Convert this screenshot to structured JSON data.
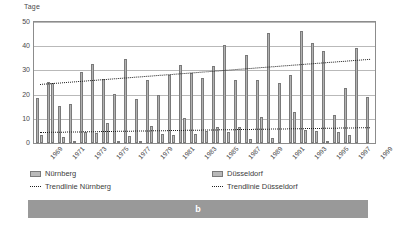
{
  "figure": {
    "caption_label": "b",
    "y_axis_title": "Tage"
  },
  "legend": {
    "items": [
      {
        "label": "Nürnberg",
        "marker": "swatch"
      },
      {
        "label": "Düsseldorf",
        "marker": "swatch"
      },
      {
        "label": "Trendlinie Nürnberg",
        "marker": "dotted-line"
      },
      {
        "label": "Trendlinie Düsseldorf",
        "marker": "dotted-line"
      }
    ]
  },
  "chart_data": {
    "type": "bar",
    "title": "",
    "subtitle": "",
    "xlabel": "",
    "ylabel": "Tage",
    "ylim": [
      0,
      50
    ],
    "yticks": [
      0,
      10,
      20,
      30,
      40,
      50
    ],
    "grid": true,
    "legend_position": "bottom",
    "categories": [
      "1969",
      "1970",
      "1971",
      "1972",
      "1973",
      "1974",
      "1975",
      "1976",
      "1977",
      "1978",
      "1979",
      "1980",
      "1981",
      "1982",
      "1983",
      "1984",
      "1985",
      "1986",
      "1987",
      "1988",
      "1989",
      "1990",
      "1991",
      "1992",
      "1993",
      "1994",
      "1995",
      "1996",
      "1997",
      "1998",
      "1999"
    ],
    "tick_labels": [
      "1969",
      "",
      "1971",
      "",
      "1973",
      "",
      "1975",
      "",
      "1977",
      "",
      "1979",
      "",
      "1981",
      "",
      "1983",
      "",
      "1985",
      "",
      "1987",
      "",
      "1989",
      "",
      "1991",
      "",
      "1993",
      "",
      "1995",
      "",
      "1997",
      "",
      "1999"
    ],
    "series": [
      {
        "name": "Nürnberg",
        "values": [
          18.5,
          25.3,
          15.2,
          16.3,
          29.5,
          32.7,
          26.3,
          20.3,
          34.8,
          18.2,
          26.2,
          20.0,
          28.3,
          32.3,
          29.0,
          27.0,
          32.0,
          40.4,
          26.0,
          36.2,
          26.2,
          45.5,
          25.0,
          28.3,
          46.3,
          41.3,
          38.2,
          11.6,
          22.8,
          39.3,
          19.1
        ]
      },
      {
        "name": "Düsseldorf",
        "values": [
          3.5,
          25.0,
          2.4,
          0.2,
          4.4,
          4.3,
          8.1,
          0.4,
          2.8,
          1.0,
          7.0,
          3.8,
          3.5,
          10.5,
          3.9,
          5.0,
          6.8,
          4.7,
          6.5,
          1.6,
          10.7,
          2.0,
          0.0,
          12.8,
          5.5,
          5.0,
          0.3,
          4.4,
          3.4,
          0.0,
          0.0
        ]
      }
    ],
    "trendlines": [
      {
        "name": "Trendlinie Nürnberg",
        "start_value": 24.3,
        "end_value": 34.7
      },
      {
        "name": "Trendlinie Düsseldorf",
        "start_value": 4.6,
        "end_value": 6.6
      }
    ],
    "colors": {
      "bar_fill": "#b3b3b3",
      "bar_stroke": "#7a7a7a",
      "trend_line": "#1e1e1e",
      "gridline": "#b9b9b9",
      "caption_bar": "#999999"
    }
  }
}
